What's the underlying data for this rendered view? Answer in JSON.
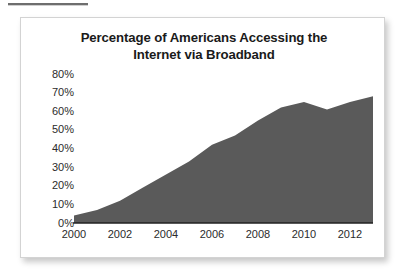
{
  "figure": {
    "title_line1": "Percentage of Americans Accessing the",
    "title_line2": "Internet via Broadband",
    "background": "#ffffff",
    "border_color": "#d3d3d3"
  },
  "chart_data": {
    "type": "area",
    "title": "Percentage of Americans Accessing the Internet via Broadband",
    "xlabel": "",
    "ylabel": "",
    "x": [
      2000,
      2001,
      2002,
      2003,
      2004,
      2005,
      2006,
      2007,
      2008,
      2009,
      2010,
      2011,
      2012,
      2013
    ],
    "values": [
      4,
      7,
      12,
      19,
      26,
      33,
      42,
      47,
      55,
      62,
      65,
      61,
      65,
      68
    ],
    "series": [
      {
        "name": "Broadband access",
        "values": [
          4,
          7,
          12,
          19,
          26,
          33,
          42,
          47,
          55,
          62,
          65,
          61,
          65,
          68
        ]
      }
    ],
    "xlim": [
      2000,
      2013
    ],
    "ylim": [
      0,
      80
    ],
    "ytick_labels": [
      "80%",
      "70%",
      "60%",
      "50%",
      "40%",
      "30%",
      "20%",
      "10%",
      "0%"
    ],
    "ytick_values": [
      80,
      70,
      60,
      50,
      40,
      30,
      20,
      10,
      0
    ],
    "xtick_labels": [
      "2000",
      "2002",
      "2004",
      "2006",
      "2008",
      "2010",
      "2012"
    ],
    "xtick_values": [
      2000,
      2002,
      2004,
      2006,
      2008,
      2010,
      2012
    ],
    "grid": false,
    "legend": false,
    "fill_color": "#5a5a5a",
    "axis_color": "#222222"
  }
}
